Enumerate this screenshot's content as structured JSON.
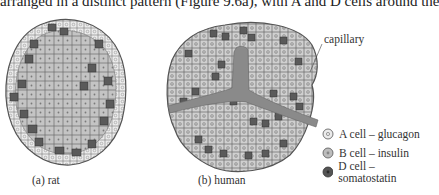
{
  "header_text": "arranged in a distinct pattern (Figure 9.6a), with A and D cells around the",
  "panels": [
    {
      "id": "a",
      "caption": "(a) rat"
    },
    {
      "id": "b",
      "caption": "(b) human"
    }
  ],
  "annotations": {
    "capillary_label": "capillary"
  },
  "legend": {
    "items": [
      {
        "label": "A cell – glucagon",
        "color": "#e6e6e6"
      },
      {
        "label": "B cell – insulin",
        "color": "#bdbdbd"
      },
      {
        "label": "D cell – somatostatin",
        "color": "#555555"
      }
    ]
  },
  "colors": {
    "capillary": "#8a8a8a",
    "outline": "#555555",
    "b_cell": "#c0c0c0",
    "a_cell": "#e8e8e8",
    "d_cell": "#5a5a5a"
  }
}
